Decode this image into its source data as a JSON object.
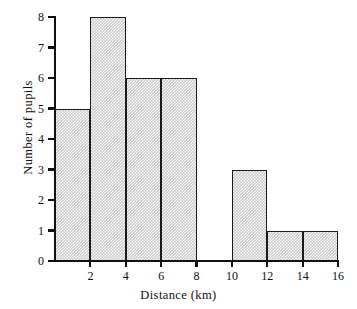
{
  "chart_data": {
    "type": "bar",
    "title": "",
    "subtitle": "",
    "xlabel": "Distance (km)",
    "ylabel": "Number of pupils",
    "xlim": [
      0,
      16
    ],
    "ylim": [
      0,
      8
    ],
    "grid": false,
    "legend": null,
    "x_tick_labels": [
      "2",
      "4",
      "6",
      "8",
      "10",
      "12",
      "14",
      "16"
    ],
    "x_tick_values": [
      2,
      4,
      6,
      8,
      10,
      12,
      14,
      16
    ],
    "y_tick_labels": [
      "0",
      "1",
      "2",
      "3",
      "4",
      "5",
      "6",
      "7",
      "8"
    ],
    "y_tick_values": [
      0,
      1,
      2,
      3,
      4,
      5,
      6,
      7,
      8
    ],
    "bin_edges": [
      0,
      2,
      4,
      6,
      8,
      10,
      12,
      14,
      16
    ],
    "categories": [
      "0-2",
      "2-4",
      "4-6",
      "6-8",
      "8-10",
      "10-12",
      "12-14",
      "14-16"
    ],
    "values": [
      5,
      8,
      6,
      6,
      0,
      3,
      1,
      1
    ],
    "bars": [
      {
        "label": "0-2",
        "start": 0,
        "end": 2,
        "value": 5
      },
      {
        "label": "2-4",
        "start": 2,
        "end": 4,
        "value": 8
      },
      {
        "label": "4-6",
        "start": 4,
        "end": 6,
        "value": 6
      },
      {
        "label": "6-8",
        "start": 6,
        "end": 8,
        "value": 6
      },
      {
        "label": "8-10",
        "start": 8,
        "end": 10,
        "value": 0
      },
      {
        "label": "10-12",
        "start": 10,
        "end": 12,
        "value": 3
      },
      {
        "label": "12-14",
        "start": 12,
        "end": 14,
        "value": 1
      },
      {
        "label": "14-16",
        "start": 14,
        "end": 16,
        "value": 1
      }
    ],
    "colors": {
      "bar_fill": "#cbcbcb",
      "bar_outline": "#1a1a1a",
      "axis": "#111111",
      "background": "#ffffff"
    }
  }
}
